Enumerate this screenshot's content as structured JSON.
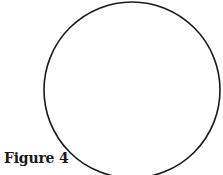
{
  "figure": {
    "caption": "Figure 4",
    "shape": "circle",
    "circle": {
      "cx": 132,
      "cy": 90,
      "r": 88,
      "stroke": "#1a1a1a",
      "stroke_width": 1.6,
      "fill": "none"
    }
  }
}
